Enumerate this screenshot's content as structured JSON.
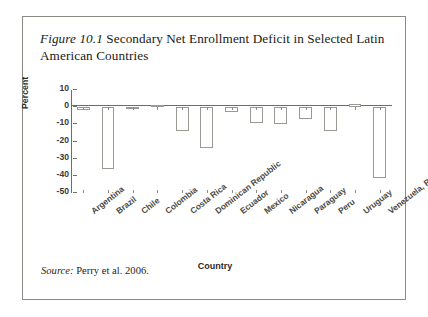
{
  "figure": {
    "number": "Figure 10.1",
    "caption": " Secondary Net Enrollment Deficit in Selected Latin American Countries",
    "source_word": "Source:",
    "source_text": " Perry et al. 2006."
  },
  "chart_data": {
    "type": "bar",
    "title": "Figure 10.1 Secondary Net Enrollment Deficit in Selected Latin American Countries",
    "xlabel": "Country",
    "ylabel": "Percent",
    "ylim": [
      -50,
      10
    ],
    "yticks": [
      10,
      0,
      -10,
      -20,
      -30,
      -40,
      -50
    ],
    "ytick_labels": [
      "10",
      "0",
      "-10",
      "-20",
      "-30",
      "-40",
      "-50"
    ],
    "grid": false,
    "legend": false,
    "categories": [
      "Argentina",
      "Brazil",
      "Chile",
      "Colombia",
      "Costa Rica",
      "Dominican Republic",
      "Ecuador",
      "Mexico",
      "Nicaragua",
      "Paraguay",
      "Peru",
      "Uruguay",
      "Venezuela, R. B. de"
    ],
    "values": [
      -1.5,
      -36,
      -0.3,
      1.5,
      -14,
      -24,
      -3,
      -9,
      -10,
      -7,
      -14,
      2,
      -41
    ]
  }
}
